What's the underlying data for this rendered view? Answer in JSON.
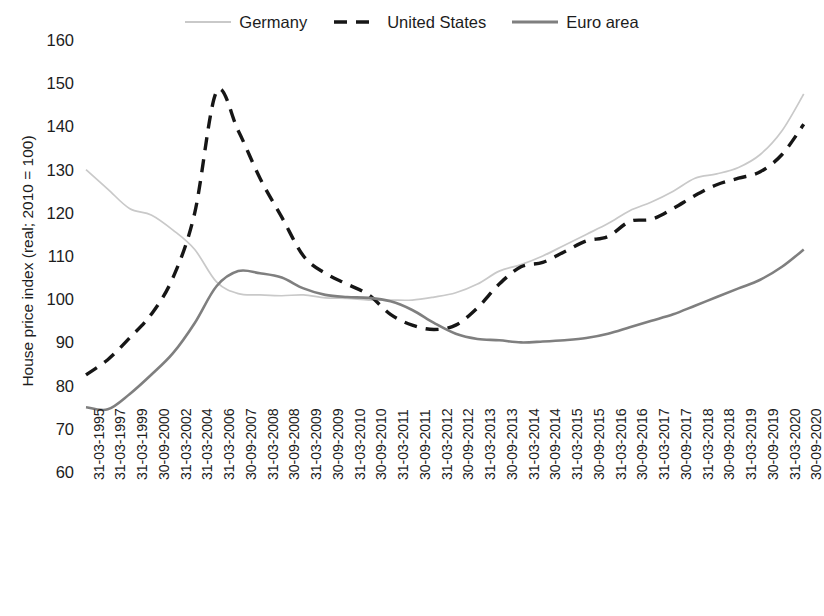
{
  "chart_data": {
    "type": "line",
    "title": "",
    "xlabel": "",
    "ylabel": "House price index (real; 2010 = 100)",
    "ylim": [
      60,
      160
    ],
    "yticks": [
      60,
      70,
      80,
      90,
      100,
      110,
      120,
      130,
      140,
      150,
      160
    ],
    "grid": false,
    "legend_position": "top-center",
    "categories": [
      "31-03-1995",
      "31-03-1997",
      "31-03-1999",
      "30-09-2000",
      "31-03-2002",
      "31-03-2004",
      "31-03-2006",
      "30-09-2007",
      "31-03-2008",
      "30-09-2008",
      "31-03-2009",
      "30-09-2009",
      "31-03-2010",
      "30-09-2010",
      "31-03-2011",
      "30-09-2011",
      "31-03-2012",
      "30-09-2012",
      "31-03-2013",
      "30-09-2013",
      "31-03-2014",
      "30-09-2014",
      "31-03-2015",
      "30-09-2015",
      "31-03-2016",
      "30-09-2016",
      "31-03-2017",
      "30-09-2017",
      "31-03-2018",
      "30-09-2018",
      "31-03-2019",
      "30-09-2019",
      "31-03-2020",
      "30-09-2020"
    ],
    "series": [
      {
        "name": "Germany",
        "color": "#c9c9c9",
        "style": "solid",
        "width": 1.7,
        "values": [
          130.0,
          125.5,
          121.0,
          119.5,
          116.0,
          111.5,
          104.0,
          101.3,
          101.0,
          100.8,
          101.0,
          100.3,
          100.2,
          99.8,
          99.8,
          99.8,
          100.5,
          101.5,
          103.5,
          106.5,
          108.0,
          110.0,
          112.5,
          115.0,
          117.5,
          120.5,
          122.5,
          125.0,
          128.0,
          129.0,
          130.5,
          133.5,
          139.0,
          147.5
        ]
      },
      {
        "name": "United States",
        "color": "#161616",
        "style": "dashed",
        "width": 3.4,
        "values": [
          82.5,
          86.0,
          91.0,
          96.5,
          105.0,
          120.0,
          148.0,
          139.0,
          128.0,
          119.0,
          110.0,
          106.0,
          103.5,
          101.0,
          96.5,
          94.0,
          93.0,
          94.0,
          98.0,
          103.5,
          107.5,
          108.5,
          111.0,
          113.5,
          114.5,
          118.0,
          118.5,
          121.0,
          124.0,
          126.5,
          128.0,
          129.5,
          133.5,
          140.5
        ]
      },
      {
        "name": "Euro area",
        "color": "#7f7f7f",
        "style": "solid",
        "width": 2.6,
        "values": [
          75.0,
          74.5,
          78.0,
          82.5,
          87.5,
          94.5,
          103.0,
          106.5,
          106.0,
          105.0,
          102.5,
          101.0,
          100.5,
          100.3,
          99.5,
          97.5,
          94.5,
          92.0,
          90.8,
          90.5,
          90.0,
          90.2,
          90.5,
          91.0,
          92.0,
          93.5,
          95.0,
          96.5,
          98.5,
          100.5,
          102.5,
          104.5,
          107.5,
          111.5
        ]
      }
    ]
  },
  "legend": {
    "items": [
      {
        "label": "Germany",
        "icon": "line-swatch-light-solid"
      },
      {
        "label": "United States",
        "icon": "line-swatch-black-dashed"
      },
      {
        "label": "Euro area",
        "icon": "line-swatch-gray-solid"
      }
    ]
  },
  "axes": {
    "y_title": "House price index (real; 2010 = 100)"
  }
}
